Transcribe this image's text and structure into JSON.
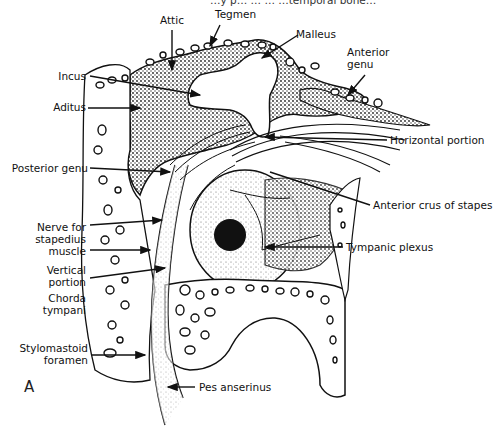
{
  "figure": {
    "panel_letter": "A",
    "top_cut_text": "…y p… … … …temporal bone…",
    "labels": {
      "attic": "Attic",
      "tegmen": "Tegmen",
      "malleus": "Malleus",
      "anterior_genu": "Anterior genu",
      "incus": "Incus",
      "aditus": "Aditus",
      "horizontal_portion": "Horizontal portion",
      "posterior_genu": "Posterior genu",
      "anterior_crus_of_stapes": "Anterior crus of stapes",
      "nerve_for_stapedius_muscle": "Nerve for stapedius muscle",
      "tympanic_plexus": "Tympanic plexus",
      "vertical_portion": "Vertical portion",
      "chorda_tympani": "Chorda tympani",
      "stylomastoid_foramen": "Stylomastoid foramen",
      "pes_anserinus": "Pes anserinus"
    },
    "colors": {
      "ink": "#111111",
      "stipple": "#555555",
      "background": "#ffffff"
    }
  }
}
